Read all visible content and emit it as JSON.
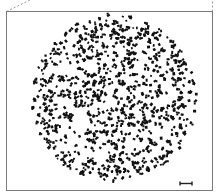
{
  "figure": {
    "width": 217,
    "height": 194,
    "background": "#ffffff",
    "frame": {
      "x": 6.5,
      "y": 11.5,
      "width": 206,
      "height": 179,
      "stroke": "#7a7a7a",
      "stroke_width": 1
    },
    "zoom_guides": [
      {
        "x1": 6.5,
        "y1": 11.5,
        "x2": 30,
        "y2": 0,
        "stroke": "#9a9a9a",
        "dash": "2,2"
      },
      {
        "x1": 212.5,
        "y1": 11.5,
        "x2": 212.5,
        "y2": 0,
        "stroke": "#9a9a9a",
        "dash": "2,2"
      }
    ],
    "specimen": {
      "shape": "circle",
      "center": [
        114,
        98
      ],
      "radius": 83,
      "particle_color": "#111111",
      "particle_count": 900,
      "particle_size_range": [
        1.6,
        3.2
      ],
      "seed": 17
    },
    "scale_bar": {
      "x1": 180,
      "x2": 192,
      "y": 183.5,
      "cap_height": 4,
      "stroke": "#222222",
      "stroke_width": 1.4
    }
  }
}
